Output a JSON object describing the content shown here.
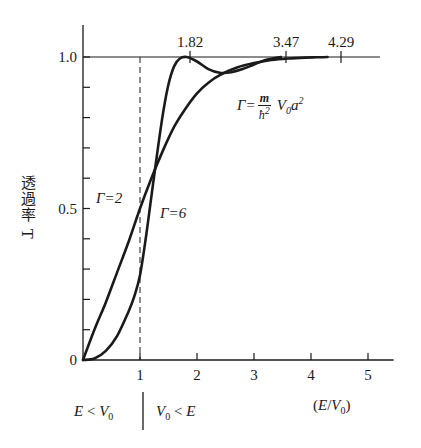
{
  "chart_data": {
    "type": "line",
    "title": "",
    "xlabel": "(E/V0)",
    "ylabel": "透過率 T",
    "xlim": [
      0,
      5.5
    ],
    "ylim": [
      0,
      1.1
    ],
    "x_ticks": [
      1,
      2,
      3,
      4,
      5
    ],
    "x_tick_labels": [
      "1",
      "2",
      "3",
      "4",
      "5"
    ],
    "y_ticks": [
      0,
      0.1,
      0.2,
      0.3,
      0.4,
      0.5,
      0.6,
      0.7,
      0.8,
      0.9,
      1.0
    ],
    "y_tick_labels": {
      "0": "0",
      "0.5": "0.5",
      "1.0": "1.0"
    },
    "grid": false,
    "reference_line": {
      "y": 1.0,
      "x_range": [
        0,
        5.2
      ]
    },
    "dashed_vline": {
      "x": 1.0
    },
    "top_markers": [
      {
        "x": 1.82,
        "label": "1.82",
        "px": 190
      },
      {
        "x": 3.47,
        "label": "3.47",
        "px": 286
      },
      {
        "x": 4.29,
        "label": "4.29",
        "px": 341
      }
    ],
    "series": [
      {
        "name": "Γ=2",
        "x": [
          0,
          0.2,
          0.4,
          0.6,
          0.8,
          1.0,
          1.2,
          1.4,
          1.6,
          1.8,
          2.0,
          2.2,
          2.4,
          2.7,
          3.0,
          3.3,
          3.6,
          3.9,
          4.1,
          4.29
        ],
        "values": [
          0,
          0.1,
          0.19,
          0.29,
          0.39,
          0.5,
          0.6,
          0.69,
          0.77,
          0.83,
          0.88,
          0.915,
          0.94,
          0.965,
          0.98,
          0.99,
          0.995,
          0.998,
          0.999,
          1.0
        ]
      },
      {
        "name": "Γ=6",
        "x": [
          0,
          0.2,
          0.4,
          0.6,
          0.8,
          0.9,
          1.0,
          1.1,
          1.2,
          1.3,
          1.4,
          1.5,
          1.6,
          1.7,
          1.82,
          2.0,
          2.2,
          2.4,
          2.6,
          2.8,
          3.0,
          3.2,
          3.47
        ],
        "values": [
          0,
          0.005,
          0.03,
          0.08,
          0.16,
          0.21,
          0.28,
          0.4,
          0.54,
          0.68,
          0.81,
          0.91,
          0.97,
          0.995,
          1.0,
          0.985,
          0.96,
          0.948,
          0.95,
          0.96,
          0.975,
          0.99,
          1.0
        ]
      }
    ],
    "annotations": [
      {
        "text": "Γ=2",
        "x": 0.5,
        "y": 0.55
      },
      {
        "text": "Γ=6",
        "x": 1.55,
        "y": 0.48
      },
      {
        "text": "Γ = (m/ħ²) V0 a²",
        "x": 3.0,
        "y": 0.78
      }
    ],
    "region_labels": {
      "left": "E < V0",
      "right": "V0 < E"
    }
  },
  "labels": {
    "ylabel": "透過率 T",
    "xlabel_open": "(",
    "xlabel_E": "E",
    "xlabel_slash": "/",
    "xlabel_V": "V",
    "xlabel_sub": "0",
    "xlabel_close": ")",
    "gamma2": "Γ=2",
    "gamma6": "Γ=6",
    "formula_lhs": "Γ=",
    "formula_num": "m",
    "formula_den": "ħ",
    "formula_den_sup": "2",
    "formula_V": "V",
    "formula_V_sub": "0",
    "formula_a": "a",
    "formula_a_sup": "2",
    "region_left_E": "E",
    "region_left_lt": " < ",
    "region_left_V": "V",
    "region_left_sub": "0",
    "region_right_V": "V",
    "region_right_sub": "0",
    "region_right_lt": " < ",
    "region_right_E": "E"
  }
}
